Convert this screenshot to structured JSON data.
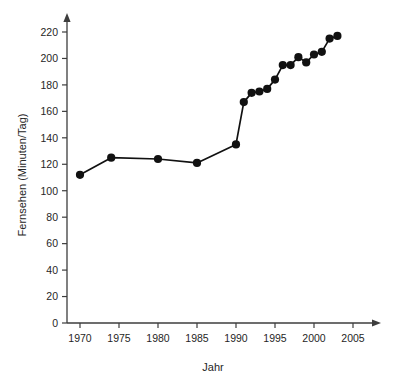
{
  "chart_data": {
    "type": "line",
    "title": "",
    "subtitle": "",
    "xlabel": "Jahr",
    "ylabel": "Fernsehen (Minuten/Tag)",
    "xlim": [
      1967,
      2007
    ],
    "ylim": [
      0,
      228
    ],
    "grid": false,
    "legend": null,
    "legend_position": "none",
    "marker": "filled-circle",
    "series_color": "#111111",
    "x_ticks": [
      1970,
      1975,
      1980,
      1985,
      1990,
      1995,
      2000,
      2005
    ],
    "x_tick_labels": [
      "1970",
      "1975",
      "1980",
      "1985",
      "1990",
      "1995",
      "2000",
      "2005"
    ],
    "y_ticks": [
      0,
      20,
      40,
      60,
      80,
      100,
      120,
      140,
      160,
      180,
      200,
      220
    ],
    "y_tick_labels": [
      "0",
      "20",
      "40",
      "60",
      "80",
      "100",
      "120",
      "140",
      "160",
      "180",
      "200",
      "220"
    ],
    "series": [
      {
        "name": "Fernsehen",
        "x": [
          1970,
          1974,
          1980,
          1985,
          1990,
          1991,
          1992,
          1993,
          1994,
          1995,
          1996,
          1997,
          1998,
          1999,
          2000,
          2001,
          2002,
          2003
        ],
        "values": [
          112,
          125,
          124,
          121,
          135,
          167,
          174,
          175,
          177,
          184,
          195,
          195,
          201,
          197,
          203,
          205,
          215,
          217
        ]
      }
    ]
  }
}
